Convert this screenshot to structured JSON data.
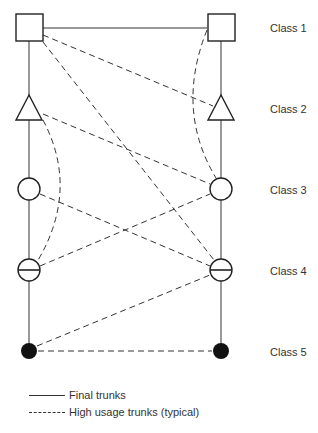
{
  "diagram": {
    "type": "telephone-switching-hierarchy",
    "columns": {
      "left_x": 29,
      "right_x": 221
    },
    "classes": [
      {
        "id": "class1",
        "label": "Class 1",
        "shape": "square",
        "y": 27,
        "label_y": 22
      },
      {
        "id": "class2",
        "label": "Class 2",
        "shape": "triangle",
        "y": 110,
        "label_y": 103
      },
      {
        "id": "class3",
        "label": "Class 3",
        "shape": "circle",
        "y": 189,
        "label_y": 184
      },
      {
        "id": "class4",
        "label": "Class 4",
        "shape": "circle-with-bar",
        "y": 270,
        "label_y": 265
      },
      {
        "id": "class5",
        "label": "Class 5",
        "shape": "filled-circle",
        "y": 351,
        "label_y": 346
      }
    ],
    "final_trunks": [
      {
        "from": "L1",
        "to": "R1"
      },
      {
        "from": "L1",
        "to": "L2"
      },
      {
        "from": "L2",
        "to": "L3"
      },
      {
        "from": "L3",
        "to": "L4"
      },
      {
        "from": "L4",
        "to": "L5"
      },
      {
        "from": "R1",
        "to": "R2"
      },
      {
        "from": "R2",
        "to": "R3"
      },
      {
        "from": "R3",
        "to": "R4"
      },
      {
        "from": "R4",
        "to": "R5"
      }
    ],
    "high_usage_trunks": [
      {
        "from": "L1",
        "to": "R2"
      },
      {
        "from": "L1",
        "to": "R4"
      },
      {
        "from": "L2",
        "to": "R3"
      },
      {
        "from": "L2",
        "to": "L4",
        "curved": true
      },
      {
        "from": "R1",
        "to": "R3",
        "curved": true
      },
      {
        "from": "L3",
        "to": "R4"
      },
      {
        "from": "L4",
        "to": "R3"
      },
      {
        "from": "L5",
        "to": "R4"
      },
      {
        "from": "L5",
        "to": "R5"
      }
    ]
  },
  "legend": {
    "final_trunks": "Final trunks",
    "high_usage_trunks": "High usage trunks (typical)"
  }
}
